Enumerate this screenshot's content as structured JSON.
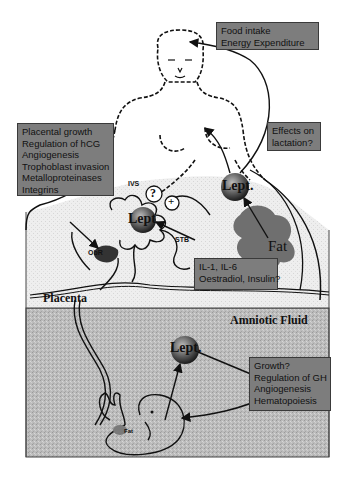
{
  "figure": {
    "regions": {
      "placenta_label": "Placenta",
      "amniotic_label": "Amniotic Fluid"
    },
    "boxes": {
      "brain": [
        "Food intake",
        "Energy Expenditure"
      ],
      "placental": [
        "Placental growth",
        "Regulation of hCG",
        "Angiogenesis",
        "Trophoblast invasion",
        "Metalloproteinases",
        "Integrins"
      ],
      "lactation": [
        "Effects on",
        "lactation?"
      ],
      "regulators": [
        "IL-1, IL-6",
        "Oestradiol, Insulin?"
      ],
      "fetal": [
        "Growth?",
        "Regulation of GH",
        "Angiogenesis",
        "Hematopoiesis"
      ]
    },
    "labels": {
      "lept_maternal": "Lept.",
      "lept_placental": "Lept",
      "lept_amniotic": "Lept.",
      "fat_maternal": "Fat",
      "fat_fetal": "Fat",
      "ivs": "IVS",
      "stb": "STB",
      "obr": "ObR",
      "question": "?",
      "plus": "+"
    },
    "colors": {
      "box_fill": "#7d7d7d",
      "placenta_fill": "#ececec",
      "amniotic_fill": "#b9b9b9",
      "fat_fill": "#6f6f6f",
      "line": "#111111"
    }
  }
}
